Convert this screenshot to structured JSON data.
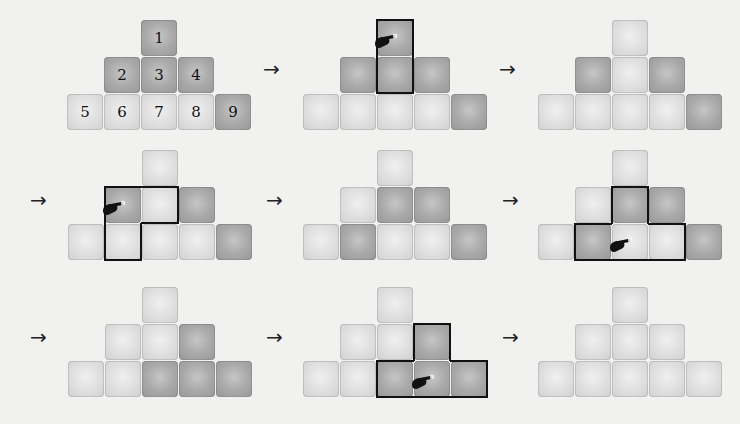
{
  "diagram": {
    "arrow_glyph": "→",
    "grid_labels": [
      "1",
      "2",
      "3",
      "4",
      "5",
      "6",
      "7",
      "8",
      "9"
    ],
    "panels": [
      {
        "id": 1,
        "states": [
          1,
          1,
          1,
          1,
          0,
          0,
          0,
          0,
          1
        ],
        "labels": true,
        "press": null
      },
      {
        "id": 2,
        "states": [
          1,
          1,
          1,
          1,
          0,
          0,
          0,
          0,
          1
        ],
        "labels": false,
        "press": 1,
        "highlight": [
          1,
          3
        ]
      },
      {
        "id": 3,
        "states": [
          0,
          1,
          0,
          1,
          0,
          0,
          0,
          0,
          1
        ],
        "labels": false,
        "press": null
      },
      {
        "id": 4,
        "states": [
          0,
          1,
          0,
          1,
          0,
          0,
          0,
          0,
          1
        ],
        "labels": false,
        "press": 2,
        "highlight": [
          2,
          3,
          6
        ]
      },
      {
        "id": 5,
        "states": [
          0,
          0,
          1,
          1,
          0,
          1,
          0,
          0,
          1
        ],
        "labels": false,
        "press": null
      },
      {
        "id": 6,
        "states": [
          0,
          0,
          1,
          1,
          0,
          1,
          0,
          0,
          1
        ],
        "labels": false,
        "press": 7,
        "highlight": [
          3,
          6,
          7,
          8
        ]
      },
      {
        "id": 7,
        "states": [
          0,
          0,
          0,
          1,
          0,
          0,
          1,
          1,
          1
        ],
        "labels": false,
        "press": null
      },
      {
        "id": 8,
        "states": [
          0,
          0,
          0,
          1,
          0,
          0,
          1,
          1,
          1
        ],
        "labels": false,
        "press": 8,
        "highlight": [
          4,
          7,
          8,
          9
        ]
      },
      {
        "id": 9,
        "states": [
          0,
          0,
          0,
          0,
          0,
          0,
          0,
          0,
          0
        ],
        "labels": false,
        "press": null
      }
    ],
    "colors": {
      "on": "#a9a9a9",
      "off": "#dedede",
      "outline": "#111111",
      "background": "#f1f1f0"
    }
  }
}
